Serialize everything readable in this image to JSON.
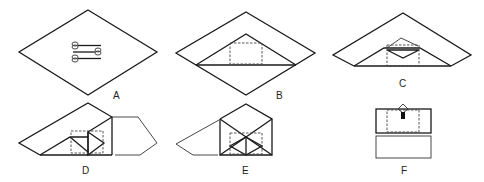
{
  "figure": {
    "panels": [
      {
        "id": "A",
        "label": "A",
        "description": "flat square wrap laid as diamond with instruments in center"
      },
      {
        "id": "B",
        "label": "B",
        "description": "bottom corner folded up over instruments"
      },
      {
        "id": "C",
        "label": "C",
        "description": "tip folded back down"
      },
      {
        "id": "D",
        "label": "D",
        "description": "right side folded in"
      },
      {
        "id": "E",
        "label": "E",
        "description": "left side folded in"
      },
      {
        "id": "F",
        "label": "F",
        "description": "top flap folded down and tucked"
      }
    ]
  }
}
